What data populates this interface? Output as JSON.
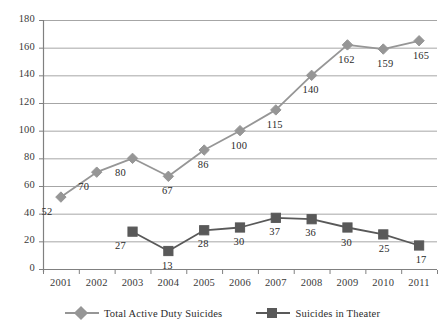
{
  "chart_data": {
    "type": "line",
    "title": "",
    "subtitle": "",
    "xlabel": "",
    "ylabel": "",
    "categories": [
      "2001",
      "2002",
      "2003",
      "2004",
      "2005",
      "2006",
      "2007",
      "2008",
      "2009",
      "2010",
      "2011"
    ],
    "series": [
      {
        "name": "Total Active Duty Suicides",
        "marker": "diamond",
        "color": "#969696",
        "values": [
          52,
          70,
          80,
          67,
          86,
          100,
          115,
          140,
          162,
          159,
          165
        ],
        "labels": [
          "52",
          "70",
          "80",
          "67",
          "86",
          "100",
          "115",
          "140",
          "162",
          "159",
          "165"
        ]
      },
      {
        "name": "Suicides in Theater",
        "marker": "square",
        "color": "#595959",
        "values": [
          null,
          null,
          27,
          13,
          28,
          30,
          37,
          36,
          30,
          25,
          17
        ],
        "labels": [
          "",
          "",
          "27",
          "13",
          "28",
          "30",
          "37",
          "36",
          "30",
          "25",
          "17"
        ]
      }
    ],
    "ylim": [
      0,
      180
    ],
    "ytick_step": 20,
    "yticks": [
      "0",
      "20",
      "40",
      "60",
      "80",
      "100",
      "120",
      "140",
      "160",
      "180"
    ],
    "grid": "horizontal",
    "legend_position": "bottom",
    "axis_color": "#808080",
    "grid_color": "#a6a6a6",
    "background": "#ffffff"
  },
  "legend": {
    "entries": [
      {
        "label": "Total Active Duty Suicides",
        "marker": "diamond-marker",
        "color": "#969696"
      },
      {
        "label": "Suicides in Theater",
        "marker": "square-marker",
        "color": "#595959"
      }
    ]
  }
}
